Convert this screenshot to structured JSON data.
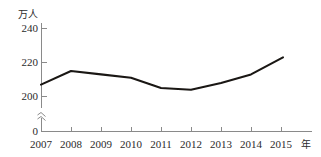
{
  "chart_data": {
    "type": "line",
    "title": "",
    "xlabel": "年",
    "ylabel": "万人",
    "categories": [
      "2007",
      "2008",
      "2009",
      "2010",
      "2011",
      "2012",
      "2013",
      "2014",
      "2015"
    ],
    "values": [
      207,
      215,
      213,
      211,
      205,
      204,
      208,
      213,
      223
    ],
    "series": [
      {
        "name": "人数",
        "values": [
          207,
          215,
          213,
          211,
          205,
          204,
          208,
          213,
          223
        ],
        "color": "#1a1714"
      }
    ],
    "y_ticks": [
      0,
      200,
      220,
      240
    ],
    "y_tick_labels": [
      "0",
      "200",
      "220",
      "240"
    ],
    "ylim": [
      0,
      248
    ],
    "axis_break": true,
    "axis_break_symbol": "≈",
    "grid": false,
    "legend": "none",
    "axis_color": "#8a8a8a",
    "line_color": "#1a1714",
    "background": "#ffffff"
  },
  "axis": {
    "y_unit": "万人",
    "x_unit": "年",
    "y_labels": [
      "240",
      "220",
      "200",
      "0"
    ],
    "x_labels": [
      "2007",
      "2008",
      "2009",
      "2010",
      "2011",
      "2012",
      "2013",
      "2014",
      "2015"
    ]
  }
}
